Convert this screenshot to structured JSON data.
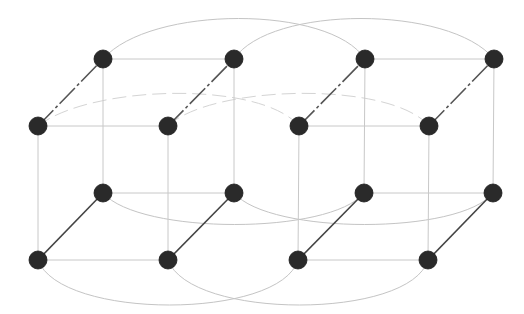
{
  "diagram": {
    "type": "network-graph",
    "colors": {
      "background": "#ffffff",
      "node_fill": "#2a2a2a",
      "depth_edge": "#444444",
      "grid_edge": "#c8c8c8",
      "wrap_edge": "#c4c4c4"
    },
    "node_radius": 9,
    "nodes": [
      {
        "id": "bt0",
        "x": 103,
        "y": 59
      },
      {
        "id": "bt1",
        "x": 234,
        "y": 59
      },
      {
        "id": "bt2",
        "x": 365,
        "y": 59
      },
      {
        "id": "bt3",
        "x": 494,
        "y": 59
      },
      {
        "id": "ft0",
        "x": 38,
        "y": 126
      },
      {
        "id": "ft1",
        "x": 168,
        "y": 126
      },
      {
        "id": "ft2",
        "x": 299,
        "y": 126
      },
      {
        "id": "ft3",
        "x": 429,
        "y": 126
      },
      {
        "id": "bb0",
        "x": 103,
        "y": 193
      },
      {
        "id": "bb1",
        "x": 234,
        "y": 193
      },
      {
        "id": "bb2",
        "x": 364,
        "y": 193
      },
      {
        "id": "bb3",
        "x": 493,
        "y": 193
      },
      {
        "id": "fb0",
        "x": 38,
        "y": 260
      },
      {
        "id": "fb1",
        "x": 168,
        "y": 260
      },
      {
        "id": "fb2",
        "x": 298,
        "y": 260
      },
      {
        "id": "fb3",
        "x": 428,
        "y": 260
      }
    ],
    "straight_edges": [
      [
        "bt0",
        "bt1"
      ],
      [
        "bt2",
        "bt3"
      ],
      [
        "ft0",
        "ft1"
      ],
      [
        "ft2",
        "ft3"
      ],
      [
        "bb0",
        "bb1"
      ],
      [
        "bb2",
        "bb3"
      ],
      [
        "fb0",
        "fb1"
      ],
      [
        "fb2",
        "fb3"
      ],
      [
        "bt0",
        "bb0"
      ],
      [
        "bt1",
        "bb1"
      ],
      [
        "bt2",
        "bb2"
      ],
      [
        "bt3",
        "bb3"
      ],
      [
        "ft0",
        "fb0"
      ],
      [
        "ft1",
        "fb1"
      ],
      [
        "ft2",
        "fb2"
      ],
      [
        "ft3",
        "fb3"
      ]
    ],
    "depth_edges_top": [
      [
        "ft0",
        "bt0"
      ],
      [
        "ft1",
        "bt1"
      ],
      [
        "ft2",
        "bt2"
      ],
      [
        "ft3",
        "bt3"
      ]
    ],
    "depth_edges_bottom": [
      [
        "fb0",
        "bb0"
      ],
      [
        "fb1",
        "bb1"
      ],
      [
        "fb2",
        "bb2"
      ],
      [
        "fb3",
        "bb3"
      ]
    ],
    "curved_edges": [
      {
        "from": "bt0",
        "to": "bt2",
        "d": "M103,59 C150,5 330,5 365,59",
        "style": "solid"
      },
      {
        "from": "bt1",
        "to": "bt3",
        "d": "M234,59 C270,5 450,5 494,59",
        "style": "solid"
      },
      {
        "from": "ft0",
        "to": "ft2",
        "d": "M38,126 C90,85 260,80 299,126",
        "style": "faint"
      },
      {
        "from": "ft1",
        "to": "ft3",
        "d": "M168,126 C210,85 390,80 429,126",
        "style": "faint"
      },
      {
        "from": "bb0",
        "to": "bb2",
        "d": "M103,193 C140,235 330,235 364,193",
        "style": "solid"
      },
      {
        "from": "bb1",
        "to": "bb3",
        "d": "M234,193 C270,235 460,235 493,193",
        "style": "solid"
      },
      {
        "from": "fb0",
        "to": "fb2",
        "d": "M38,260 C60,320 280,320 298,260",
        "style": "solid"
      },
      {
        "from": "fb1",
        "to": "fb3",
        "d": "M168,260 C190,320 410,320 428,260",
        "style": "solid"
      }
    ]
  }
}
